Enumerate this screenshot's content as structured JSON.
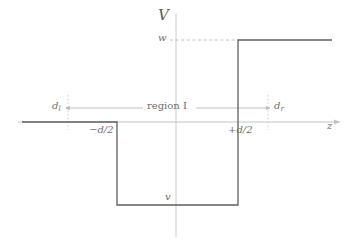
{
  "figure": {
    "name": "step-potential-diagram",
    "axes": {
      "vertical_label": "V",
      "horizontal_label": "z"
    },
    "levels": {
      "upper_label": "w",
      "lower_label": "v"
    },
    "boundaries": {
      "left_label_prefix": "−d/",
      "left_label_denom": "2",
      "left_label": "−d/2",
      "right_label": "+d/2"
    },
    "markers": {
      "left_base": "d",
      "left_sub": "l",
      "right_base": "d",
      "right_sub": "r"
    },
    "region": {
      "label": "region I"
    },
    "colors": {
      "curve": "#5a5a5a",
      "axis": "#bdbdbd",
      "guide": "#c9c9c9",
      "dashed": "#bfbfbf",
      "text": "#6e6e6e"
    },
    "geometry": {
      "axis_y": 122,
      "axis_x": 176,
      "well_left_x": 117,
      "well_right_x": 238,
      "well_bottom_y": 205,
      "upper_level_y": 40,
      "guide_left_x": 68,
      "guide_right_x": 268,
      "region_line_y": 108
    }
  }
}
